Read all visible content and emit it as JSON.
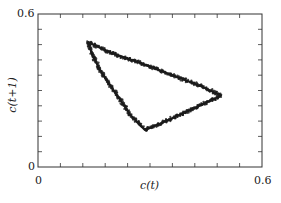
{
  "chart_data": {
    "type": "scatter",
    "title": "",
    "xlabel": "c(t)",
    "ylabel": "c(t+1)",
    "xlim": [
      0,
      0.6
    ],
    "ylim": [
      0,
      0.6
    ],
    "x_tick_labels": [
      "0",
      "0.6"
    ],
    "y_tick_labels": [
      "0",
      "0.6"
    ],
    "minor_tick_spacing": 0.06,
    "grid": false,
    "legend": null,
    "series": [
      {
        "name": "attractor",
        "marker_color": "#1a1a1a",
        "x": [
          0.134,
          0.2,
          0.28,
          0.36,
          0.44,
          0.49,
          0.44,
          0.38,
          0.32,
          0.287,
          0.25,
          0.21,
          0.17,
          0.145,
          0.134
        ],
        "y": [
          0.49,
          0.445,
          0.405,
          0.36,
          0.315,
          0.28,
          0.245,
          0.205,
          0.165,
          0.145,
          0.2,
          0.285,
          0.37,
          0.44,
          0.49
        ]
      }
    ],
    "vertices": [
      {
        "x": 0.134,
        "y": 0.49
      },
      {
        "x": 0.49,
        "y": 0.28
      },
      {
        "x": 0.287,
        "y": 0.145
      }
    ]
  },
  "labels": {
    "x_title": "c(t)",
    "y_title": "c(t+1)",
    "x_min": "0",
    "x_max": "0.6",
    "y_min": "0",
    "y_max": "0.6"
  }
}
